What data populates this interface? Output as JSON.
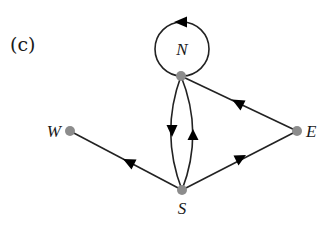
{
  "panel_label": "(c)",
  "colors": {
    "edge": "#222222",
    "node_fill": "#8c8c8c",
    "arrowhead": "#000000",
    "background": "#ffffff"
  },
  "nodes": [
    {
      "id": "N",
      "label": "N",
      "x": 181,
      "y": 76,
      "label_pos": "inside-loop"
    },
    {
      "id": "W",
      "label": "W",
      "x": 70,
      "y": 131,
      "label_pos": "left"
    },
    {
      "id": "E",
      "label": "E",
      "x": 297,
      "y": 131,
      "label_pos": "right"
    },
    {
      "id": "S",
      "label": "S",
      "x": 182,
      "y": 190,
      "label_pos": "below"
    }
  ],
  "edges": [
    {
      "from": "N",
      "to": "N",
      "type": "self-loop",
      "direction": "counterclockwise"
    },
    {
      "from": "N",
      "to": "S",
      "type": "curved-left"
    },
    {
      "from": "S",
      "to": "N",
      "type": "curved-right"
    },
    {
      "from": "E",
      "to": "N",
      "type": "straight"
    },
    {
      "from": "S",
      "to": "E",
      "type": "straight"
    },
    {
      "from": "S",
      "to": "W",
      "type": "straight"
    }
  ]
}
